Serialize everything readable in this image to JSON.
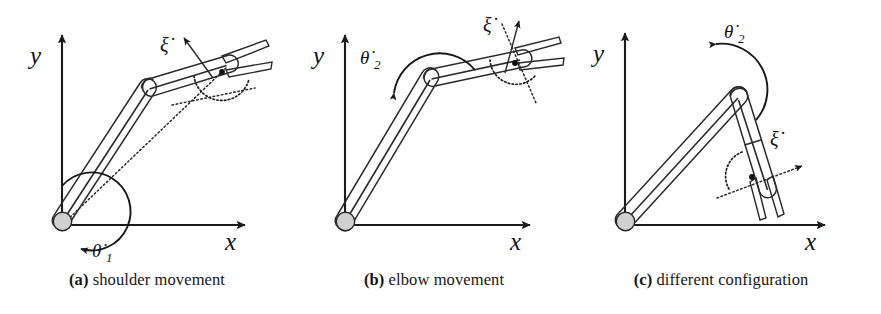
{
  "figure": {
    "kind": "technical-line-drawing",
    "background_color": "#ffffff",
    "ink_color": "#1a1a1a",
    "link_fill_color": "#d6d6d6",
    "link_edge_color": "#2a2a2a"
  },
  "panels": [
    {
      "id": "a",
      "caption_tag": "(a)",
      "caption_text": "shoulder movement",
      "axes": {
        "x_label": "x",
        "y_label": "y"
      },
      "labels": {
        "joint_rate": "θ̇1",
        "joint_rate_symbol": "theta",
        "joint_rate_subscript": "1",
        "endeffector_rate": "ξ̇",
        "endeffector_rate_symbol": "xi"
      },
      "annotations": [
        "large circular arc about the shoulder joint with arrowhead",
        "dotted line from shoulder origin to end-effector",
        "dotted arc at the gripper marking the end-effector orientation",
        "arrow for end-effector velocity xi-dot"
      ]
    },
    {
      "id": "b",
      "caption_tag": "(b)",
      "caption_text": "elbow movement",
      "axes": {
        "x_label": "x",
        "y_label": "y"
      },
      "labels": {
        "joint_rate": "θ̇2",
        "joint_rate_symbol": "theta",
        "joint_rate_subscript": "2",
        "endeffector_rate": "ξ̇",
        "endeffector_rate_symbol": "xi"
      },
      "annotations": [
        "arc over the elbow joint with arrowhead pointing down-left",
        "dotted line through the gripper",
        "dotted arc at the gripper marking the end-effector orientation",
        "arrow for end-effector velocity xi-dot"
      ]
    },
    {
      "id": "c",
      "caption_tag": "(c)",
      "caption_text": "different configuration",
      "axes": {
        "x_label": "x",
        "y_label": "y"
      },
      "labels": {
        "joint_rate": "θ̇2",
        "joint_rate_symbol": "theta",
        "joint_rate_subscript": "2",
        "endeffector_rate": "ξ̇",
        "endeffector_rate_symbol": "xi"
      },
      "annotations": [
        "arc curling around the elbow joint with arrowhead pointing left",
        "dotted line through the gripper",
        "dotted arc at the gripper marking the end-effector orientation",
        "arrow for end-effector velocity xi-dot"
      ]
    }
  ],
  "glyphs": {
    "theta": "θ",
    "xi": "ξ",
    "dot": "̇",
    "x": "x",
    "y": "y",
    "sub1": "1",
    "sub2": "2"
  }
}
